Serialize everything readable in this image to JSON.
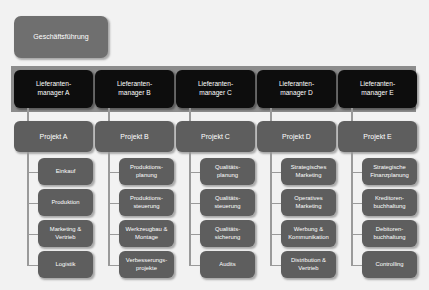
{
  "chart_data": {
    "type": "diagram",
    "root": "Geschäftsführung",
    "levels": [
      "Geschäftsführung",
      "Lieferantenmanager",
      "Projekt",
      "Aufgabenbereiche"
    ]
  },
  "executive": {
    "label": "Geschäftsführung"
  },
  "columns": [
    {
      "manager_line1": "Lieferanten-",
      "manager_line2": "manager A",
      "project": "Projekt A",
      "tasks": [
        {
          "line1": "Einkauf",
          "line2": ""
        },
        {
          "line1": "Produktion",
          "line2": ""
        },
        {
          "line1": "Marketing &",
          "line2": "Vertrieb"
        },
        {
          "line1": "Logistik",
          "line2": ""
        }
      ]
    },
    {
      "manager_line1": "Lieferanten-",
      "manager_line2": "manager B",
      "project": "Projekt B",
      "tasks": [
        {
          "line1": "Produktions-",
          "line2": "planung"
        },
        {
          "line1": "Produktions-",
          "line2": "steuerung"
        },
        {
          "line1": "Werkzeugbau &",
          "line2": "Montage"
        },
        {
          "line1": "Verbesserungs-",
          "line2": "projekte"
        }
      ]
    },
    {
      "manager_line1": "Lieferanten-",
      "manager_line2": "manager C",
      "project": "Projekt C",
      "tasks": [
        {
          "line1": "Qualitäts-",
          "line2": "planung"
        },
        {
          "line1": "Qualitäts-",
          "line2": "steuerung"
        },
        {
          "line1": "Qualitäts-",
          "line2": "sicherung"
        },
        {
          "line1": "Audits",
          "line2": ""
        }
      ]
    },
    {
      "manager_line1": "Lieferanten-",
      "manager_line2": "manager D",
      "project": "Projekt D",
      "tasks": [
        {
          "line1": "Strategisches",
          "line2": "Marketing"
        },
        {
          "line1": "Operatives",
          "line2": "Marketing"
        },
        {
          "line1": "Werbung &",
          "line2": "Kommunikation"
        },
        {
          "line1": "Distribution &",
          "line2": "Vertrieb"
        }
      ]
    },
    {
      "manager_line1": "Lieferanten-",
      "manager_line2": "manager E",
      "project": "Projekt E",
      "tasks": [
        {
          "line1": "Strategische",
          "line2": "Finanzplanung"
        },
        {
          "line1": "Kreditoren-",
          "line2": "buchhaltung"
        },
        {
          "line1": "Debitoren-",
          "line2": "buchhaltung"
        },
        {
          "line1": "Controlling",
          "line2": ""
        }
      ]
    }
  ]
}
